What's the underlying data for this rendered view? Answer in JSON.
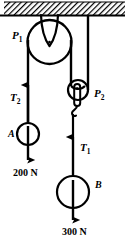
{
  "figure": {
    "type": "physics-free-body-diagram",
    "width": 125,
    "height": 236,
    "background_color": "#ffffff",
    "ink_color": "#000000"
  },
  "ceiling": {
    "name": "hatched-ceiling-support",
    "x": 4,
    "y": 2,
    "width": 121,
    "height": 14,
    "hatch_angle_deg": 45,
    "hatch_color": "#000000"
  },
  "pulleys": [
    {
      "id": "P1",
      "label": "P",
      "subscript": "1",
      "kind": "fixed-pulley",
      "cx": 49.5,
      "cy": 42,
      "r": 22,
      "label_x": 12,
      "label_y": 30,
      "attached_to": "ceiling"
    },
    {
      "id": "P2",
      "label": "P",
      "subscript": "2",
      "kind": "movable-pulley",
      "cx": 78,
      "cy": 90,
      "r": 10,
      "label_x": 94,
      "label_y": 88,
      "attached_to": "ceiling-rope"
    }
  ],
  "tensions": [
    {
      "id": "T2",
      "label": "T",
      "subscript": "2",
      "direction": "up",
      "label_x": 10,
      "label_y": 92,
      "rope_x": 28,
      "arrow_tip_y": 84,
      "arrow_tail_y": 122
    },
    {
      "id": "T1",
      "label": "T",
      "subscript": "1",
      "direction": "up",
      "label_x": 80,
      "label_y": 142,
      "rope_x": 73,
      "arrow_tip_y": 136,
      "arrow_tail_y": 176
    }
  ],
  "bodies": [
    {
      "id": "A",
      "label": "A",
      "cx": 28,
      "cy": 134,
      "r": 11,
      "label_x": 8,
      "label_y": 129,
      "weight_text": "200 N",
      "weight_value": 200,
      "weight_unit": "N",
      "weight_direction": "down",
      "weight_label_x": 13,
      "weight_label_y": 168,
      "arrow_tip_y": 164
    },
    {
      "id": "B",
      "label": "B",
      "cx": 73,
      "cy": 192,
      "r": 16,
      "label_x": 95,
      "label_y": 180,
      "weight_text": "300 N",
      "weight_value": 300,
      "weight_unit": "N",
      "weight_direction": "down",
      "weight_label_x": 62,
      "weight_label_y": 227,
      "arrow_tip_y": 224
    }
  ],
  "ropes": [
    {
      "name": "rope-ceiling-to-P1-hanger",
      "from": "ceiling",
      "to": "P1",
      "x": 50,
      "y1": 16,
      "y2": 30
    },
    {
      "name": "rope-ceiling-to-P2",
      "from": "ceiling",
      "to": "P2",
      "x": 88,
      "y1": 16,
      "y2": 88
    },
    {
      "name": "rope-P1-left-to-A",
      "from": "P1",
      "to": "A",
      "x": 28,
      "y1": 44,
      "y2": 123
    },
    {
      "name": "rope-P1-right-to-P2",
      "from": "P1",
      "to": "P2",
      "x": 71,
      "y1": 44,
      "y2": 86
    },
    {
      "name": "rope-P2-hook-to-B",
      "from": "P2-hook",
      "to": "B",
      "x": 73,
      "y1": 112,
      "y2": 177
    }
  ],
  "labels_list": [
    "P1",
    "P2",
    "T2",
    "T1",
    "A",
    "B",
    "200 N",
    "300 N"
  ]
}
